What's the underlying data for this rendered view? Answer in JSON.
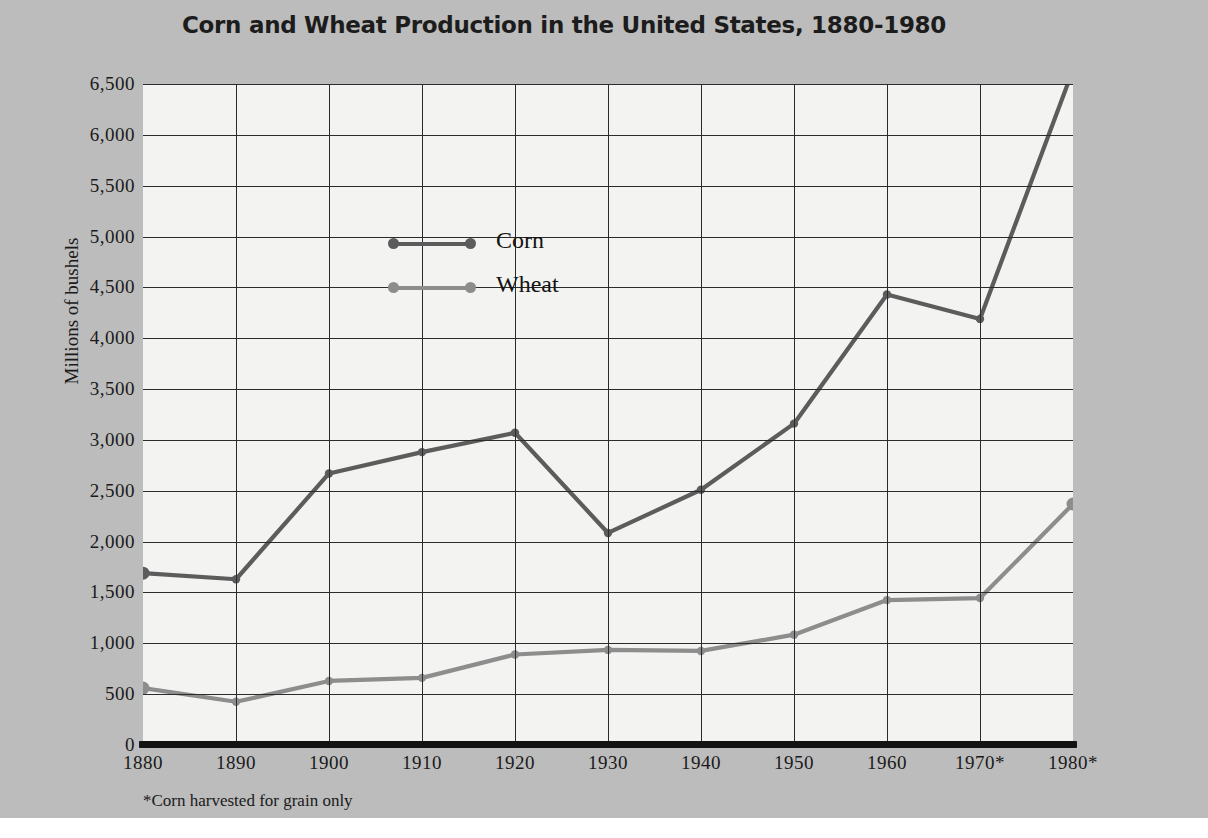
{
  "figure": {
    "title": "Corn and Wheat Production in the United States, 1880-1980",
    "footnote": "*Corn harvested for grain only",
    "background_color": "#bcbcbc",
    "plot_background_color": "#f3f3f1"
  },
  "chart_data": {
    "type": "line",
    "title": "Corn and Wheat Production in the United States, 1880-1980",
    "xlabel": "",
    "ylabel": "Millions of bushels",
    "x": [
      1880,
      1890,
      1900,
      1910,
      1920,
      1930,
      1940,
      1950,
      1960,
      1970,
      1980
    ],
    "categories": [
      "1880",
      "1890",
      "1900",
      "1910",
      "1920",
      "1930",
      "1940",
      "1950",
      "1960",
      "1970*",
      "1980*"
    ],
    "series": [
      {
        "name": "Corn",
        "color": "#5c5c5c",
        "values": [
          1690,
          1630,
          2670,
          2880,
          3070,
          2085,
          2510,
          3160,
          4430,
          4190,
          6640
        ]
      },
      {
        "name": "Wheat",
        "color": "#8d8d8d",
        "values": [
          560,
          425,
          630,
          660,
          890,
          935,
          925,
          1085,
          1425,
          1445,
          2370
        ]
      }
    ],
    "ylim": [
      0,
      6500
    ],
    "xlim": [
      1880,
      1980
    ],
    "yticks": [
      0,
      500,
      1000,
      1500,
      2000,
      2500,
      3000,
      3500,
      4000,
      4500,
      5000,
      5500,
      6000,
      6500
    ],
    "ytick_labels": [
      "0",
      "500",
      "1,000",
      "1,500",
      "2,000",
      "2,500",
      "3,000",
      "3,500",
      "4,000",
      "4,500",
      "5,000",
      "5,500",
      "6,000",
      "6,500"
    ],
    "grid": true,
    "legend_position": "upper-left-inside",
    "annotations": [
      "*Corn harvested for grain only"
    ]
  },
  "legend": {
    "entries": [
      {
        "label": "Corn",
        "color": "#5c5c5c"
      },
      {
        "label": "Wheat",
        "color": "#8d8d8d"
      }
    ]
  }
}
